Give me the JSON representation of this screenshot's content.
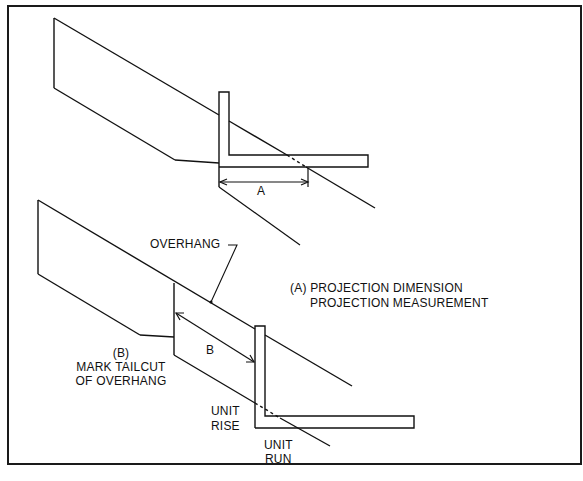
{
  "figure": {
    "labels": {
      "dim_a": "A",
      "dim_b": "B",
      "overhang": "OVERHANG",
      "legend_a_line1": "(A)  PROJECTION DIMENSION",
      "legend_a_line2": "PROJECTION MEASUREMENT",
      "legend_b_line1": "(B)",
      "legend_b_line2": "MARK TAILCUT",
      "legend_b_line3": "OF OVERHANG",
      "unit_rise_line1": "UNIT",
      "unit_rise_line2": "RISE",
      "unit_run_line1": "UNIT",
      "unit_run_line2": "RUN"
    },
    "colors": {
      "ink": "#111111",
      "background": "#ffffff",
      "caption": "#9a9a9a"
    }
  }
}
